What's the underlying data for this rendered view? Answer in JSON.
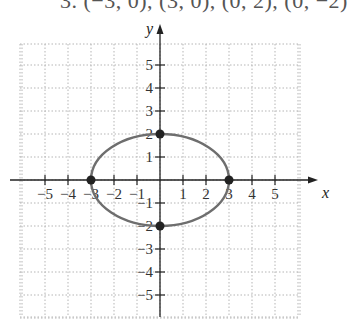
{
  "caption": "3. (−3, 0), (3, 0), (0, 2), (0, −2)",
  "chart_data": {
    "type": "line",
    "title": "",
    "xlabel": "x",
    "ylabel": "y",
    "xlim": [
      -6,
      6
    ],
    "ylim": [
      -6,
      6
    ],
    "grid": true,
    "x_ticks": [
      -5,
      -4,
      -3,
      -2,
      -1,
      1,
      2,
      3,
      4,
      5
    ],
    "y_ticks": [
      -5,
      -4,
      -3,
      -2,
      -1,
      1,
      2,
      3,
      4,
      5
    ],
    "x_tick_labels": [
      "−5",
      "−4",
      "−3",
      "−2",
      "−1",
      "1",
      "2",
      "3",
      "4",
      "5"
    ],
    "y_tick_labels": [
      "−5",
      "−4",
      "−3",
      "−2",
      "−1",
      "1",
      "2",
      "3",
      "4",
      "5"
    ],
    "series": [
      {
        "name": "ellipse x^2/9 + y^2/4 = 1",
        "shape": "ellipse",
        "center": [
          0,
          0
        ],
        "semi_major_x": 3,
        "semi_minor_y": 2,
        "color": "#6e6e6e"
      },
      {
        "name": "vertices and co-vertices",
        "shape": "points",
        "points": [
          [
            -3,
            0
          ],
          [
            3,
            0
          ],
          [
            0,
            2
          ],
          [
            0,
            -2
          ]
        ],
        "color": "#222222"
      }
    ]
  },
  "layout": {
    "origin_px": [
      160,
      180
    ],
    "unit_px": 23,
    "grid_px": {
      "left": 20,
      "top": 44,
      "right": 300,
      "bottom": 317
    },
    "colors": {
      "grid": "#b5b5b5",
      "axis": "#222222",
      "curve": "#6e6e6e",
      "point": "#222222"
    }
  }
}
